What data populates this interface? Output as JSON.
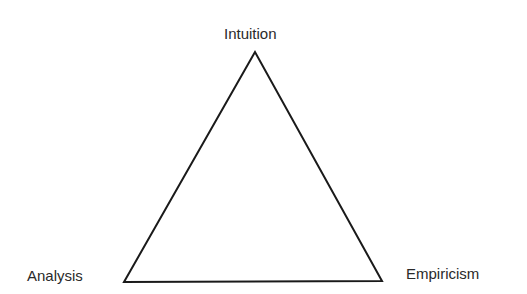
{
  "diagram": {
    "type": "triangle",
    "stroke_color": "#1a1a1a",
    "vertices": {
      "top": {
        "label": "Intuition"
      },
      "bottom_left": {
        "label": "Analysis"
      },
      "bottom_right": {
        "label": "Empiricism"
      }
    }
  }
}
